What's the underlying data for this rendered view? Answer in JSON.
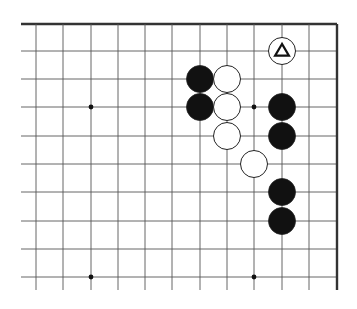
{
  "diagram": {
    "type": "go-board-fragment",
    "background": "#ffffff",
    "line_color": "#555555",
    "edge_color": "#333333",
    "columns_x": [
      36,
      63,
      91,
      118,
      145,
      172,
      200,
      227,
      254,
      282,
      309,
      337
    ],
    "rows_y": [
      24,
      51,
      79,
      107,
      136,
      164,
      192,
      221,
      249,
      277
    ],
    "line_start_x": 21,
    "line_end_y": 290,
    "edges": {
      "top": true,
      "right": true,
      "left": false,
      "bottom": false
    },
    "stone_radius": 13.5,
    "hoshi": [
      {
        "col": 2,
        "row": 3
      },
      {
        "col": 8,
        "row": 3
      },
      {
        "col": 2,
        "row": 9
      },
      {
        "col": 8,
        "row": 9
      }
    ],
    "stones": [
      {
        "color": "black",
        "col": 6,
        "row": 2
      },
      {
        "color": "black",
        "col": 6,
        "row": 3
      },
      {
        "color": "white",
        "col": 7,
        "row": 2
      },
      {
        "color": "white",
        "col": 7,
        "row": 3
      },
      {
        "color": "white",
        "col": 7,
        "row": 4
      },
      {
        "color": "white",
        "col": 8,
        "row": 5
      },
      {
        "color": "black",
        "col": 9,
        "row": 3
      },
      {
        "color": "black",
        "col": 9,
        "row": 4
      },
      {
        "color": "black",
        "col": 9,
        "row": 6
      },
      {
        "color": "black",
        "col": 9,
        "row": 7
      },
      {
        "color": "white",
        "col": 9,
        "row": 1,
        "mark": "triangle"
      }
    ],
    "marker_labels": {
      "triangle": "Δ"
    }
  }
}
